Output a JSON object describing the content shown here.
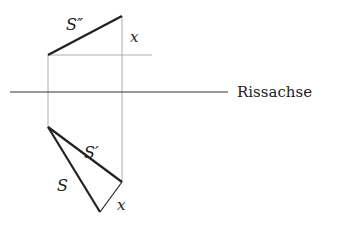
{
  "labels": {
    "s_double_prime": "S″",
    "x_top": "x",
    "axis": "Rissachse",
    "s_prime": "S′",
    "s": "S",
    "x_bottom": "x"
  },
  "colors": {
    "line": "#222222",
    "thin_line": "#888888",
    "background": "#ffffff"
  }
}
